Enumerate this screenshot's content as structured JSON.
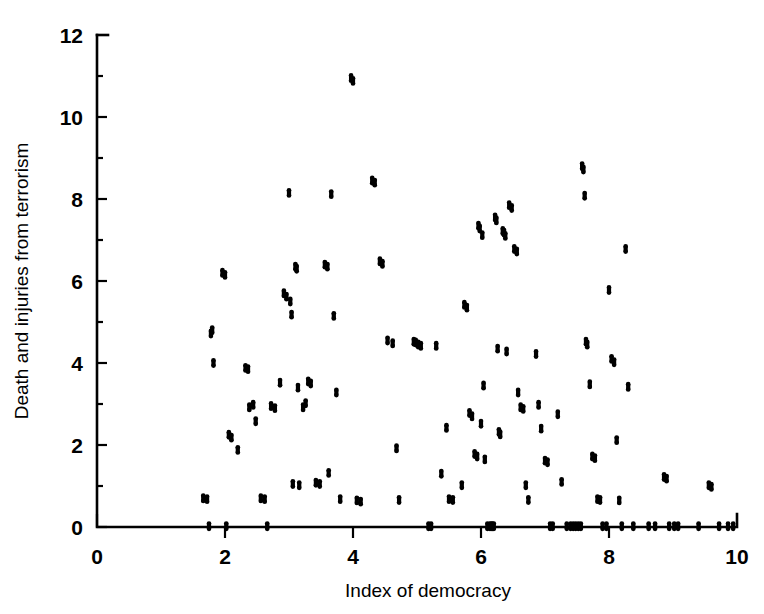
{
  "chart_data": {
    "type": "scatter",
    "title": "",
    "xlabel": "Index of democracy",
    "ylabel": "Death and injuries from terrorism",
    "xlim": [
      0,
      10
    ],
    "ylim": [
      0,
      12
    ],
    "xticks": [
      0,
      2,
      4,
      6,
      8,
      10
    ],
    "yticks": [
      0,
      2,
      4,
      6,
      8,
      10,
      12
    ],
    "xtick_labels": [
      "0",
      "2",
      "4",
      "6",
      "8",
      "10"
    ],
    "ytick_labels": [
      "0",
      "2",
      "4",
      "6",
      "8",
      "10",
      "12"
    ],
    "x_minor_ticks": [
      1,
      3,
      5,
      7,
      9
    ],
    "y_minor_ticks": [
      1,
      3,
      5,
      7,
      9,
      11
    ],
    "grid": false,
    "legend": null,
    "marker_color": "#000000",
    "marker_style": "filled-circle",
    "n_points": 148,
    "series": [
      {
        "name": "countries",
        "points": [
          [
            1.66,
            0.7
          ],
          [
            1.72,
            0.68
          ],
          [
            1.75,
            0.02
          ],
          [
            1.78,
            4.72
          ],
          [
            1.8,
            4.8
          ],
          [
            1.82,
            4.0
          ],
          [
            1.96,
            6.2
          ],
          [
            2.0,
            6.15
          ],
          [
            2.02,
            0.02
          ],
          [
            2.06,
            2.25
          ],
          [
            2.1,
            2.18
          ],
          [
            2.2,
            1.88
          ],
          [
            2.32,
            3.88
          ],
          [
            2.36,
            3.85
          ],
          [
            2.38,
            2.92
          ],
          [
            2.44,
            2.98
          ],
          [
            2.48,
            2.58
          ],
          [
            2.56,
            0.7
          ],
          [
            2.62,
            0.68
          ],
          [
            2.66,
            0.02
          ],
          [
            2.72,
            2.95
          ],
          [
            2.78,
            2.9
          ],
          [
            2.86,
            3.52
          ],
          [
            2.92,
            5.7
          ],
          [
            2.96,
            5.62
          ],
          [
            3.0,
            8.15
          ],
          [
            3.02,
            5.5
          ],
          [
            3.04,
            5.18
          ],
          [
            3.06,
            1.05
          ],
          [
            3.1,
            6.35
          ],
          [
            3.12,
            6.3
          ],
          [
            3.14,
            3.4
          ],
          [
            3.16,
            1.02
          ],
          [
            3.22,
            2.92
          ],
          [
            3.26,
            3.02
          ],
          [
            3.3,
            3.55
          ],
          [
            3.34,
            3.5
          ],
          [
            3.42,
            1.08
          ],
          [
            3.48,
            1.05
          ],
          [
            3.56,
            6.4
          ],
          [
            3.6,
            6.35
          ],
          [
            3.62,
            1.32
          ],
          [
            3.66,
            8.12
          ],
          [
            3.7,
            5.15
          ],
          [
            3.74,
            3.28
          ],
          [
            3.8,
            0.68
          ],
          [
            3.97,
            10.95
          ],
          [
            4.0,
            10.88
          ],
          [
            4.06,
            0.65
          ],
          [
            4.12,
            0.62
          ],
          [
            4.3,
            8.45
          ],
          [
            4.34,
            8.4
          ],
          [
            4.42,
            6.48
          ],
          [
            4.46,
            6.42
          ],
          [
            4.54,
            4.55
          ],
          [
            4.62,
            4.48
          ],
          [
            4.68,
            1.92
          ],
          [
            4.72,
            0.66
          ],
          [
            4.95,
            4.52
          ],
          [
            4.98,
            4.5
          ],
          [
            5.02,
            4.45
          ],
          [
            5.06,
            4.42
          ],
          [
            5.18,
            0.02
          ],
          [
            5.22,
            0.02
          ],
          [
            5.3,
            4.42
          ],
          [
            5.38,
            1.3
          ],
          [
            5.46,
            2.42
          ],
          [
            5.5,
            0.68
          ],
          [
            5.56,
            0.66
          ],
          [
            5.7,
            1.02
          ],
          [
            5.74,
            5.42
          ],
          [
            5.78,
            5.35
          ],
          [
            5.82,
            2.78
          ],
          [
            5.86,
            2.7
          ],
          [
            5.9,
            1.78
          ],
          [
            5.94,
            1.72
          ],
          [
            5.96,
            7.35
          ],
          [
            5.98,
            7.28
          ],
          [
            6.0,
            2.52
          ],
          [
            6.02,
            7.12
          ],
          [
            6.04,
            3.45
          ],
          [
            6.06,
            1.65
          ],
          [
            6.1,
            0.02
          ],
          [
            6.14,
            0.02
          ],
          [
            6.16,
            0.02
          ],
          [
            6.18,
            0.02
          ],
          [
            6.2,
            0.02
          ],
          [
            6.22,
            7.55
          ],
          [
            6.24,
            7.48
          ],
          [
            6.26,
            4.35
          ],
          [
            6.28,
            2.32
          ],
          [
            6.3,
            2.26
          ],
          [
            6.34,
            7.22
          ],
          [
            6.36,
            7.18
          ],
          [
            6.38,
            7.1
          ],
          [
            6.4,
            4.28
          ],
          [
            6.44,
            7.85
          ],
          [
            6.48,
            7.78
          ],
          [
            6.52,
            6.78
          ],
          [
            6.56,
            6.72
          ],
          [
            6.58,
            3.28
          ],
          [
            6.62,
            2.92
          ],
          [
            6.66,
            2.88
          ],
          [
            6.7,
            1.02
          ],
          [
            6.74,
            0.66
          ],
          [
            6.86,
            4.22
          ],
          [
            6.9,
            2.98
          ],
          [
            6.94,
            2.4
          ],
          [
            7.0,
            1.62
          ],
          [
            7.04,
            1.58
          ],
          [
            7.08,
            0.02
          ],
          [
            7.12,
            0.02
          ],
          [
            7.2,
            2.75
          ],
          [
            7.26,
            1.1
          ],
          [
            7.34,
            0.02
          ],
          [
            7.4,
            0.02
          ],
          [
            7.44,
            0.02
          ],
          [
            7.48,
            0.02
          ],
          [
            7.52,
            0.02
          ],
          [
            7.56,
            0.02
          ],
          [
            7.58,
            8.8
          ],
          [
            7.6,
            8.72
          ],
          [
            7.62,
            8.08
          ],
          [
            7.64,
            4.52
          ],
          [
            7.66,
            4.45
          ],
          [
            7.7,
            3.48
          ],
          [
            7.74,
            1.72
          ],
          [
            7.78,
            1.68
          ],
          [
            7.82,
            0.68
          ],
          [
            7.86,
            0.66
          ],
          [
            7.9,
            0.02
          ],
          [
            7.96,
            0.02
          ],
          [
            8.0,
            5.78
          ],
          [
            8.04,
            4.1
          ],
          [
            8.08,
            4.02
          ],
          [
            8.12,
            2.12
          ],
          [
            8.16,
            0.65
          ],
          [
            8.2,
            0.02
          ],
          [
            8.26,
            6.78
          ],
          [
            8.3,
            3.42
          ],
          [
            8.38,
            0.02
          ],
          [
            8.62,
            0.02
          ],
          [
            8.72,
            0.02
          ],
          [
            8.86,
            1.22
          ],
          [
            8.9,
            1.18
          ],
          [
            8.94,
            0.02
          ],
          [
            9.02,
            0.02
          ],
          [
            9.08,
            0.02
          ],
          [
            9.4,
            0.02
          ],
          [
            9.56,
            1.02
          ],
          [
            9.6,
            0.98
          ],
          [
            9.72,
            0.02
          ],
          [
            9.86,
            0.02
          ],
          [
            9.94,
            0.02
          ]
        ]
      }
    ]
  },
  "axes": {
    "x_title": "Index of democracy",
    "y_title": "Death and injuries from terrorism"
  }
}
